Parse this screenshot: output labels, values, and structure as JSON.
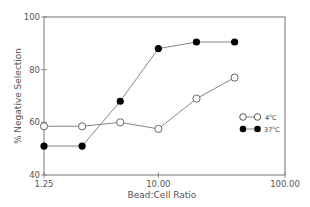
{
  "chart_data": {
    "type": "line",
    "title": "",
    "xlabel": "Bead:Cell Ratio",
    "ylabel": "% Negative Selection",
    "x_scale": "log",
    "xlim": [
      1.25,
      100
    ],
    "ylim": [
      40,
      100
    ],
    "x_ticks": [
      1.25,
      10,
      100
    ],
    "x_tick_labels": [
      "1.25",
      "10.00",
      "100.00"
    ],
    "y_ticks": [
      40,
      60,
      80,
      100
    ],
    "y_tick_labels": [
      "40",
      "60",
      "80",
      "100"
    ],
    "grid": false,
    "legend_position": "right-middle inside",
    "x": [
      1.25,
      2.5,
      5,
      10,
      20,
      40
    ],
    "series": [
      {
        "name": "4°C",
        "marker": "open-circle",
        "values": [
          58.5,
          58.5,
          60,
          57.5,
          69,
          77
        ]
      },
      {
        "name": "37°C",
        "marker": "filled-circle",
        "values": [
          51,
          51,
          68,
          88,
          90.5,
          90.5
        ]
      }
    ]
  },
  "legend": {
    "items": [
      {
        "label_main": "4",
        "label_sup": "o",
        "label_unit": "C"
      },
      {
        "label_main": "37",
        "label_sup": "o",
        "label_unit": "C"
      }
    ]
  },
  "style": {
    "axis_color": "#777777",
    "line_color": "#777777",
    "marker_color": "#000000"
  }
}
